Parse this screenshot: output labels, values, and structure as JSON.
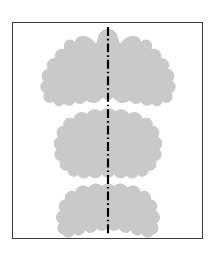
{
  "figure": {
    "title": "Symmetric Inkblot Figure",
    "background_color": "#ffffff",
    "frame": {
      "border_color": "#3a3a3a",
      "border_width_px": 1.5,
      "x": 12,
      "y": 22,
      "width": 191,
      "height": 217
    },
    "blot": {
      "fill_color": "#c9c9c9",
      "description": "Three vertically stacked bilaterally-symmetric inkblot masses",
      "count": 3,
      "parts": [
        {
          "name": "upper-blot",
          "label": "upper blot mass"
        },
        {
          "name": "middle-blot",
          "label": "middle blot mass"
        },
        {
          "name": "lower-blot",
          "label": "lower blot mass"
        }
      ]
    },
    "symmetry_axis": {
      "name": "vertical axis of symmetry",
      "color": "#000000",
      "style": "dash-dot",
      "x": 96,
      "y_start": 4,
      "y_end": 213,
      "stroke_width": 2.2,
      "dash_pattern": "9 3 1.6 3"
    }
  }
}
